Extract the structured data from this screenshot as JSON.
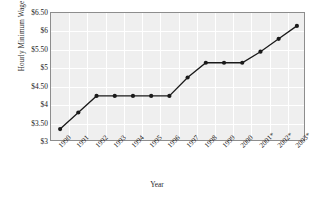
{
  "chart_data": {
    "type": "line",
    "title": "",
    "xlabel": "Year",
    "ylabel": "Hourly Minimum Wage",
    "categories": [
      "1990",
      "1991",
      "1992",
      "1993",
      "1994",
      "1995",
      "1996",
      "1997",
      "1998",
      "1999",
      "2000",
      "2001*",
      "2002*",
      "2003*"
    ],
    "values": [
      3.35,
      3.8,
      4.25,
      4.25,
      4.25,
      4.25,
      4.25,
      4.75,
      5.15,
      5.15,
      5.15,
      5.45,
      5.8,
      6.15
    ],
    "series": [
      {
        "name": "Hourly Minimum Wage",
        "values": [
          3.35,
          3.8,
          4.25,
          4.25,
          4.25,
          4.25,
          4.25,
          4.75,
          5.15,
          5.15,
          5.15,
          5.45,
          5.8,
          6.15
        ]
      }
    ],
    "ylim": [
      3.0,
      6.5
    ],
    "yticks": [
      3.0,
      3.5,
      4.0,
      4.5,
      5.0,
      5.5,
      6.0,
      6.5
    ],
    "ytick_labels": [
      "$3",
      "$3.50",
      "$4",
      "$4.50",
      "$5",
      "$5.50",
      "$6",
      "$6.50"
    ],
    "grid": true,
    "legend": "none",
    "marker": "filled-circle",
    "line_color": "#1a1a1a",
    "plot_background": "#efefef",
    "grid_color": "#ffffff"
  },
  "axes": {
    "y_title": "Hourly Minimum Wage",
    "x_title": "Year"
  }
}
